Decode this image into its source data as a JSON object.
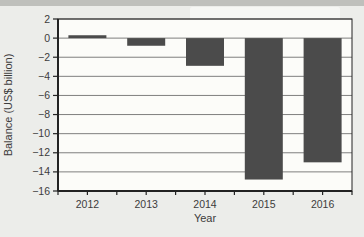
{
  "page": {
    "background": "#ecedea",
    "scan_edge_color": "#bfc0bc"
  },
  "chart_data": {
    "type": "bar",
    "title": "",
    "xlabel": "Year",
    "ylabel": "Balance (US$ billion)",
    "categories": [
      "2012",
      "2013",
      "2014",
      "2015",
      "2016"
    ],
    "values": [
      0.3,
      -0.8,
      -2.9,
      -14.8,
      -13.0
    ],
    "ylim": [
      -16,
      2
    ],
    "ytick_step": 2,
    "grid": "horizontal",
    "legend": "none",
    "bar_color": "#4b4b4b",
    "plot_bg": "#fcfcf9",
    "frame_color": "#222222",
    "grid_color": "#707070",
    "text_color": "#3c3c3c"
  }
}
